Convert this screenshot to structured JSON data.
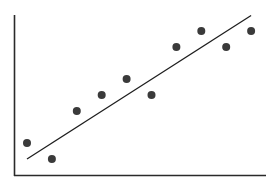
{
  "chart_data": {
    "type": "scatter",
    "title": "",
    "xlabel": "",
    "ylabel": "",
    "x": [
      1,
      2,
      3,
      4,
      5,
      6,
      7,
      8,
      9,
      10
    ],
    "series": [
      {
        "name": "points",
        "values": [
          2,
          1,
          4,
          5,
          6,
          5,
          8,
          9,
          8,
          9
        ]
      }
    ],
    "trendline": {
      "type": "linear",
      "start": [
        1,
        1.0
      ],
      "end": [
        10,
        10.0
      ]
    },
    "xlim": [
      0.5,
      10.6
    ],
    "ylim": [
      0,
      10
    ],
    "grid": false,
    "legend": "none",
    "ticks": false
  },
  "colors": {
    "point": "#3a3a3a",
    "line": "#1e1e1e",
    "axis": "#2a2a2a",
    "background": "#ffffff"
  }
}
